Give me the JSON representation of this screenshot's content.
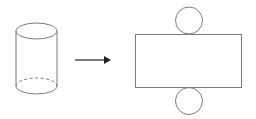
{
  "diagram": {
    "description": "Cylinder and its net (unfolded surface)",
    "stroke_color": "#7a7a7a",
    "arrow_color": "#222222",
    "background": "#ffffff",
    "cylinder": {
      "cx": 36.5,
      "top_cy": 31,
      "bottom_cy": 86,
      "rx": 20.5,
      "ry": 8,
      "hidden_edge_style": "dashed"
    },
    "arrow": {
      "x1": 75,
      "x2": 110,
      "y": 60,
      "direction": "right"
    },
    "net": {
      "rectangle": {
        "x": 135,
        "y": 34,
        "width": 106,
        "height": 53
      },
      "top_circle": {
        "cx": 189,
        "cy": 20.5,
        "r": 13.5
      },
      "bottom_circle": {
        "cx": 189,
        "cy": 100.5,
        "r": 13.5
      }
    }
  }
}
